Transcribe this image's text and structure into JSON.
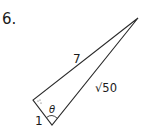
{
  "problem": {
    "number": "6."
  },
  "figure": {
    "type": "right-triangle",
    "vertices": {
      "apex": [
        138,
        18
      ],
      "right_angle": [
        33,
        100
      ],
      "bottom": [
        52,
        125
      ]
    },
    "labels": {
      "hypotenuse_left_side": "7",
      "long_side": "√50",
      "short_side": "1",
      "angle": "θ"
    },
    "stroke_color": "#2a2a2a"
  }
}
